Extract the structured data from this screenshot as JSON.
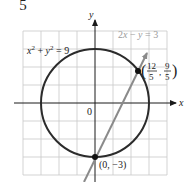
{
  "fragment": {
    "denominator": "5"
  },
  "graph": {
    "grid": {
      "xmin": -4,
      "xmax": 4,
      "ymin": -4,
      "ymax": 4,
      "step": 1,
      "origin_px": [
        95,
        103
      ],
      "unit_px": 18
    },
    "axes": {
      "x_label": "x",
      "y_label": "y",
      "origin_label": "0"
    },
    "curves": [
      {
        "id": "circle",
        "equation": "x² + y² = 9",
        "type": "circle",
        "radius": 3,
        "color": "#2b2b2b"
      },
      {
        "id": "line",
        "equation": "2x − y = 3",
        "type": "line",
        "color": "#8a8a8a"
      }
    ],
    "points": [
      {
        "label": "(0, −3)",
        "x": 0,
        "y": -3
      },
      {
        "label_num_x": "12",
        "label_den_x": "5",
        "label_num_y": "9",
        "label_den_y": "5",
        "x": 2.4,
        "y": 1.8
      }
    ],
    "colors": {
      "grid": "#c8c8c8",
      "axis": "#1a1a1a",
      "circle": "#2b2b2b",
      "line": "#8a8a8a",
      "line_label": "#9a9a9a"
    }
  }
}
